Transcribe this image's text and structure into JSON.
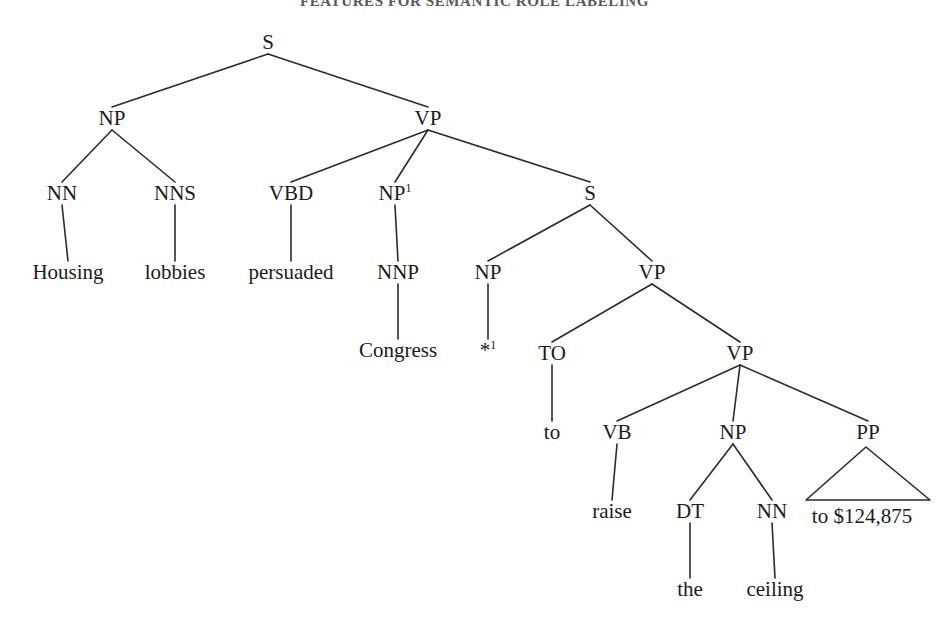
{
  "page": {
    "running_head": "FEATURES FOR SEMANTIC ROLE LABELING",
    "background_color": "#ffffff",
    "line_color": "#2b2b2b",
    "text_color": "#1b1b1b",
    "width": 949,
    "height": 633
  },
  "chart_data": {
    "type": "diagram",
    "diagram_type": "constituency-parse-tree",
    "title": "FEATURES FOR SEMANTIC ROLE LABELING",
    "sentence": "Housing lobbies persuaded Congress to raise the ceiling to $124,875",
    "bracketed": "(S (NP (NN Housing) (NNS lobbies)) (VP (VBD persuaded) (NP-1 (NNP Congress)) (S (NP (-NONE- *-1)) (VP (TO to) (VP (VB raise) (NP (DT the) (NN ceiling)) (PP to $124,875))))))",
    "coreference_index": "1",
    "nodes": [
      {
        "id": "S0",
        "label": "S",
        "sup": "",
        "x": 268,
        "y": 42,
        "kind": "nonterminal"
      },
      {
        "id": "NP1",
        "label": "NP",
        "sup": "",
        "x": 112,
        "y": 118,
        "kind": "nonterminal"
      },
      {
        "id": "VP1",
        "label": "VP",
        "sup": "",
        "x": 428,
        "y": 118,
        "kind": "nonterminal"
      },
      {
        "id": "NN1",
        "label": "NN",
        "sup": "",
        "x": 62,
        "y": 193,
        "kind": "preterminal"
      },
      {
        "id": "NNS1",
        "label": "NNS",
        "sup": "",
        "x": 175,
        "y": 193,
        "kind": "preterminal"
      },
      {
        "id": "VBD1",
        "label": "VBD",
        "sup": "",
        "x": 291,
        "y": 193,
        "kind": "preterminal"
      },
      {
        "id": "NPsup",
        "label": "NP",
        "sup": "1",
        "x": 395,
        "y": 193,
        "kind": "nonterminal"
      },
      {
        "id": "S1",
        "label": "S",
        "sup": "",
        "x": 590,
        "y": 193,
        "kind": "nonterminal"
      },
      {
        "id": "NNP1",
        "label": "NNP",
        "sup": "",
        "x": 398,
        "y": 272,
        "kind": "preterminal"
      },
      {
        "id": "NP2",
        "label": "NP",
        "sup": "",
        "x": 488,
        "y": 272,
        "kind": "nonterminal"
      },
      {
        "id": "VP2",
        "label": "VP",
        "sup": "",
        "x": 652,
        "y": 272,
        "kind": "nonterminal"
      },
      {
        "id": "TO1",
        "label": "TO",
        "sup": "",
        "x": 552,
        "y": 353,
        "kind": "preterminal"
      },
      {
        "id": "VP3",
        "label": "VP",
        "sup": "",
        "x": 740,
        "y": 353,
        "kind": "nonterminal"
      },
      {
        "id": "VB1",
        "label": "VB",
        "sup": "",
        "x": 617,
        "y": 432,
        "kind": "preterminal"
      },
      {
        "id": "NP3",
        "label": "NP",
        "sup": "",
        "x": 733,
        "y": 432,
        "kind": "nonterminal"
      },
      {
        "id": "PP1",
        "label": "PP",
        "sup": "",
        "x": 868,
        "y": 432,
        "kind": "nonterminal"
      },
      {
        "id": "DT1",
        "label": "DT",
        "sup": "",
        "x": 690,
        "y": 511,
        "kind": "preterminal"
      },
      {
        "id": "NN2",
        "label": "NN",
        "sup": "",
        "x": 772,
        "y": 511,
        "kind": "preterminal"
      }
    ],
    "leaves": [
      {
        "id": "w1",
        "text": "Housing",
        "x": 68,
        "y": 272,
        "parent": "NN1"
      },
      {
        "id": "w2",
        "text": "lobbies",
        "x": 175,
        "y": 272,
        "parent": "NNS1"
      },
      {
        "id": "w3",
        "text": "persuaded",
        "x": 291,
        "y": 272,
        "parent": "VBD1"
      },
      {
        "id": "w4",
        "text": "Congress",
        "x": 398,
        "y": 350,
        "parent": "NNP1"
      },
      {
        "id": "w5",
        "text": "*",
        "sup": "1",
        "x": 488,
        "y": 350,
        "parent": "NP2",
        "trace": true
      },
      {
        "id": "w6",
        "text": "to",
        "x": 552,
        "y": 432,
        "parent": "TO1"
      },
      {
        "id": "w7",
        "text": "raise",
        "x": 612,
        "y": 511,
        "parent": "VB1"
      },
      {
        "id": "w8",
        "text": "the",
        "x": 690,
        "y": 589,
        "parent": "DT1"
      },
      {
        "id": "w9",
        "text": "ceiling",
        "x": 775,
        "y": 589,
        "parent": "NN2"
      },
      {
        "id": "w10",
        "text": "to $124,875",
        "x": 862,
        "y": 516,
        "parent": "PP1",
        "triangle": true
      }
    ],
    "edges": [
      [
        "S0",
        "NP1"
      ],
      [
        "S0",
        "VP1"
      ],
      [
        "NP1",
        "NN1"
      ],
      [
        "NP1",
        "NNS1"
      ],
      [
        "VP1",
        "VBD1"
      ],
      [
        "VP1",
        "NPsup"
      ],
      [
        "VP1",
        "S1"
      ],
      [
        "NN1",
        "w1"
      ],
      [
        "NNS1",
        "w2"
      ],
      [
        "VBD1",
        "w3"
      ],
      [
        "NPsup",
        "NNP1"
      ],
      [
        "NNP1",
        "w4"
      ],
      [
        "S1",
        "NP2"
      ],
      [
        "S1",
        "VP2"
      ],
      [
        "NP2",
        "w5"
      ],
      [
        "VP2",
        "TO1"
      ],
      [
        "VP2",
        "VP3"
      ],
      [
        "TO1",
        "w6"
      ],
      [
        "VP3",
        "VB1"
      ],
      [
        "VP3",
        "NP3"
      ],
      [
        "VP3",
        "PP1"
      ],
      [
        "VB1",
        "w7"
      ],
      [
        "NP3",
        "DT1"
      ],
      [
        "NP3",
        "NN2"
      ],
      [
        "DT1",
        "w8"
      ],
      [
        "NN2",
        "w9"
      ],
      [
        "PP1",
        "w10"
      ]
    ],
    "triangle": {
      "apex_x": 866,
      "apex_y": 447,
      "left_x": 806,
      "left_y": 500,
      "right_x": 930,
      "right_y": 500,
      "label": "to $124,875"
    }
  }
}
